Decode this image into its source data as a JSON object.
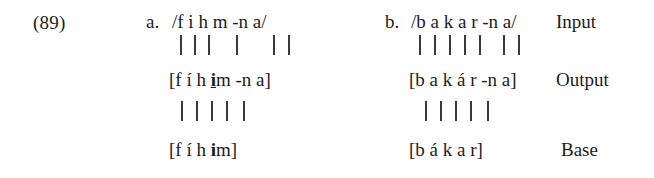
{
  "figure": {
    "example_number": "(89)",
    "tier_labels": {
      "input": "Input",
      "output": "Output",
      "base": "Base"
    },
    "items": [
      {
        "letter": "a.",
        "input": "/f i h  m -n a/",
        "input_plain": "/fihm-na/",
        "output": "[f í h i m -n a]",
        "output_plain": "[fíhim-na]",
        "output_prefix": "[f í h ",
        "output_marked": "i",
        "output_suffix": "m -n a]",
        "base": "[f í h i m]",
        "base_plain": "[fíhim]",
        "base_prefix": "[f í h ",
        "base_marked": "i",
        "base_suffix": "m]",
        "input_to_output_links": 6,
        "output_to_base_links": 5
      },
      {
        "letter": "b.",
        "input": "/b a k a r -n a/",
        "input_plain": "/bakar-na/",
        "output": "[b a k á r -n a]",
        "output_plain": "[bakár-na]",
        "output_prefix": "[b a k á r -n a]",
        "output_marked": "",
        "output_suffix": "",
        "base": "[b á k a r]",
        "base_plain": "[bákar]",
        "base_prefix": "[b á k a r]",
        "base_marked": "",
        "base_suffix": "",
        "input_to_output_links": 7,
        "output_to_base_links": 5
      }
    ]
  },
  "colors": {
    "text": "#1c1c1c",
    "line": "#3a3a3a",
    "background": "#ffffff"
  }
}
